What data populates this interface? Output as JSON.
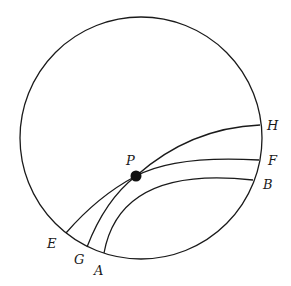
{
  "diagram": {
    "title": "",
    "circle": {
      "cx": 141,
      "cy": 138,
      "r": 121
    },
    "point": {
      "label": "P",
      "cx": 136,
      "cy": 176,
      "r": 5.5
    },
    "arcs": [
      {
        "name": "arc-E-H",
        "from": "E",
        "to": "H",
        "path": "M66,233 Q98,196 136,176 Q190,128 260,125"
      },
      {
        "name": "arc-G-F",
        "from": "G",
        "to": "F",
        "path": "M87,247 Q105,200 136,176 Q175,155 259,160"
      },
      {
        "name": "arc-A-B",
        "from": "A",
        "to": "B",
        "path": "M104,253 Q120,165 253,180"
      }
    ],
    "labels": [
      {
        "text": "H",
        "x": 267,
        "y": 130
      },
      {
        "text": "F",
        "x": 268,
        "y": 165
      },
      {
        "text": "B",
        "x": 263,
        "y": 189
      },
      {
        "text": "P",
        "x": 126,
        "y": 165
      },
      {
        "text": "E",
        "x": 47,
        "y": 248
      },
      {
        "text": "G",
        "x": 74,
        "y": 264
      },
      {
        "text": "A",
        "x": 94,
        "y": 275
      }
    ]
  }
}
